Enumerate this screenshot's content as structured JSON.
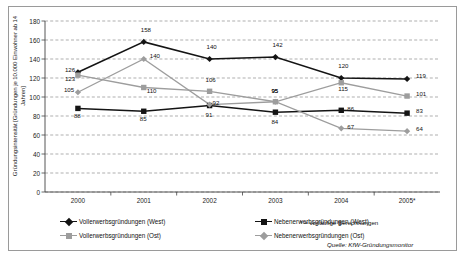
{
  "chart_data": {
    "type": "line",
    "title": "",
    "ylabel": "Gründungsintensität [Gründungen je 10.000 Einwohner ab 14 Jahren]",
    "xlabel": "",
    "categories": [
      "2000",
      "2001",
      "2002",
      "2003",
      "2004",
      "2005*"
    ],
    "ylim": [
      0,
      180
    ],
    "ytickstep": 20,
    "yticks": [
      "180",
      "160",
      "140",
      "120",
      "100",
      "80",
      "60",
      "40",
      "20",
      "0"
    ],
    "grid": "horizontal-dashed",
    "legend_position": "bottom",
    "series": [
      {
        "name": "Vollerwerbsgründungen (West)",
        "color": "#141414",
        "marker": "diamond",
        "values": [
          126,
          158,
          140,
          142,
          120,
          119
        ]
      },
      {
        "name": "Nebenerwerbsgründungen (West)",
        "color": "#141414",
        "marker": "square",
        "values": [
          88,
          85,
          91,
          84,
          86,
          83
        ]
      },
      {
        "name": "Vollerwerbsgründungen (Ost)",
        "color": "#9d9d9d",
        "marker": "square",
        "values": [
          123,
          110,
          106,
          95,
          115,
          101
        ]
      },
      {
        "name": "Nebenerwerbsgründungen (Ost)",
        "color": "#9d9d9d",
        "marker": "diamond",
        "values": [
          105,
          140,
          92,
          95,
          67,
          64
        ]
      }
    ]
  },
  "footnote": "* = vorläufige Berechnungen",
  "source": "Quelle: KfW-Gründungsmonitor"
}
